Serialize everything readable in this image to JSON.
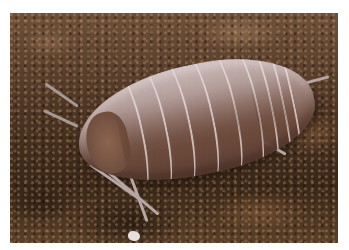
{
  "image": {
    "subject": "woodlouse (isopod) on soil",
    "colors": {
      "background": "#ffffff",
      "soil_dark": "#3a2718",
      "soil_light": "#6e5039",
      "shell_light": "#d2c3c3",
      "shell_dark": "#5f4137"
    }
  }
}
